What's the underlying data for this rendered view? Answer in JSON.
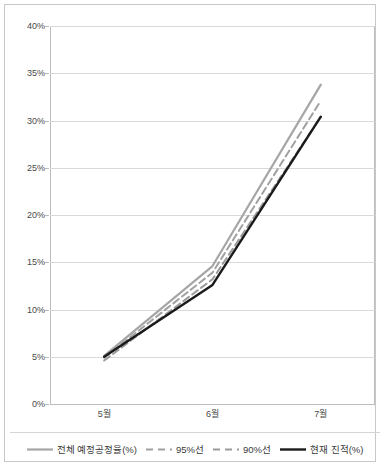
{
  "chart_data": {
    "type": "line",
    "title": "",
    "subtitle": "",
    "xlabel": "",
    "ylabel": "",
    "categories": [
      "5월",
      "6월",
      "7월"
    ],
    "ylim": [
      0,
      40
    ],
    "ytick_step": 5,
    "ytick_labels": [
      "40%",
      "35%",
      "30%",
      "25%",
      "20%",
      "15%",
      "10%",
      "5%",
      "0%"
    ],
    "ytick_values": [
      40,
      35,
      30,
      25,
      20,
      15,
      10,
      5,
      0
    ],
    "grid": true,
    "legend_position": "bottom",
    "series": [
      {
        "name": "전체 예정공정율(%)",
        "values": [
          5.1,
          14.6,
          33.8
        ],
        "color": "#a6a6a6",
        "style": "solid",
        "width": 2.2
      },
      {
        "name": "95%선",
        "values": [
          4.9,
          13.9,
          32.1
        ],
        "color": "#a0a0a0",
        "style": "dashed",
        "width": 2.0
      },
      {
        "name": "90%선",
        "values": [
          4.6,
          13.2,
          30.4
        ],
        "color": "#9a9a9a",
        "style": "dashed",
        "width": 2.0
      },
      {
        "name": "현재 진적(%)",
        "values": [
          5.0,
          12.6,
          30.4
        ],
        "color": "#1a1a1a",
        "style": "solid",
        "width": 2.4
      }
    ]
  },
  "legend": {
    "items": [
      {
        "label": "전체 예정공정율(%)"
      },
      {
        "label": "95%선"
      },
      {
        "label": "90%선"
      },
      {
        "label": "현재 진적(%)"
      }
    ]
  },
  "colors": {
    "plan_line": "#a6a6a6",
    "line_95": "#a0a0a0",
    "line_90": "#9a9a9a",
    "actual_line": "#1a1a1a",
    "grid": "#d9d9d9",
    "frame": "#c8c8c8",
    "text": "#4a4a4a",
    "background": "#ffffff"
  },
  "artifact": {
    "bottom_text": ""
  }
}
